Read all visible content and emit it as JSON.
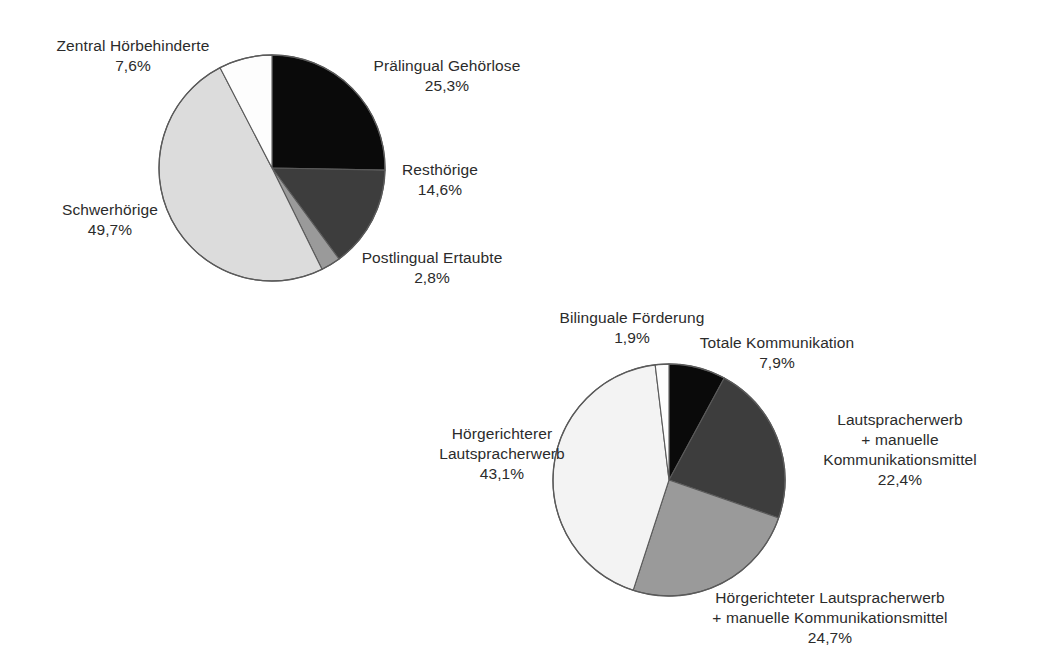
{
  "page": {
    "background": "#ffffff",
    "width": 1043,
    "height": 665
  },
  "palette": {
    "black": "#0a0a0a",
    "dark_gray": "#3d3d3d",
    "mid_gray": "#9a9a9a",
    "light_gray": "#dcdcdc",
    "white": "#fdfdfd",
    "outline": "#5a5a5a",
    "text": "#2b2b2b"
  },
  "chart_data": [
    {
      "type": "pie",
      "id": "hearing-impairment-types",
      "title": "",
      "labels": [
        "Prälingual Gehörlose",
        "Resthörige",
        "Postlingual Ertaubte",
        "Schwerhörige",
        "Zentral Hörbehinderte"
      ],
      "values": [
        25.3,
        14.6,
        2.8,
        49.7,
        7.6
      ],
      "value_labels": [
        "25,3%",
        "14,6%",
        "2,8%",
        "49,7%",
        "7,6%"
      ],
      "colors": [
        "#0a0a0a",
        "#3d3d3d",
        "#9a9a9a",
        "#dcdcdc",
        "#fdfdfd"
      ],
      "start_angle_deg": 0,
      "direction": "clockwise",
      "legend": "none",
      "grid": false,
      "slices": [
        {
          "label": "Prälingual Gehörlose",
          "value": 25.3,
          "value_label": "25,3%",
          "color": "#0a0a0a"
        },
        {
          "label": "Resthörige",
          "value": 14.6,
          "value_label": "14,6%",
          "color": "#3d3d3d"
        },
        {
          "label": "Postlingual Ertaubte",
          "value": 2.8,
          "value_label": "2,8%",
          "color": "#9a9a9a"
        },
        {
          "label": "Schwerhörige",
          "value": 49.7,
          "value_label": "49,7%",
          "color": "#dcdcdc"
        },
        {
          "label": "Zentral Hörbehinderte",
          "value": 7.6,
          "value_label": "7,6%",
          "color": "#fdfdfd"
        }
      ]
    },
    {
      "type": "pie",
      "id": "communication-methods",
      "title": "",
      "labels": [
        "Totale Kommunikation",
        "Lautspracherwerb + manuelle Kommunikationsmittel",
        "Hörgerichteter Lautspracherwerb + manuelle Kommunikationsmittel",
        "Hörgerichterer Lautspracherwerb",
        "Bilinguale Förderung"
      ],
      "values": [
        7.9,
        22.4,
        24.7,
        43.1,
        1.9
      ],
      "value_labels": [
        "7,9%",
        "22,4%",
        "24,7%",
        "43,1%",
        "1,9%"
      ],
      "colors": [
        "#0a0a0a",
        "#3d3d3d",
        "#9a9a9a",
        "#f3f3f3",
        "#fdfdfd"
      ],
      "start_angle_deg": 0,
      "direction": "clockwise",
      "legend": "none",
      "grid": false,
      "slices": [
        {
          "label": "Totale Kommunikation",
          "value": 7.9,
          "value_label": "7,9%",
          "color": "#0a0a0a"
        },
        {
          "label": "Lautspracherwerb + manuelle Kommunikationsmittel",
          "value": 22.4,
          "value_label": "22,4%",
          "color": "#3d3d3d"
        },
        {
          "label": "Hörgerichteter Lautspracherwerb + manuelle Kommunikationsmittel",
          "value": 24.7,
          "value_label": "24,7%",
          "color": "#9a9a9a"
        },
        {
          "label": "Hörgerichterer Lautspracherwerb",
          "value": 43.1,
          "value_label": "43,1%",
          "color": "#f3f3f3"
        },
        {
          "label": "Bilinguale Förderung",
          "value": 1.9,
          "value_label": "1,9%",
          "color": "#fdfdfd"
        }
      ]
    }
  ],
  "chart1": {
    "labels": {
      "zentral": {
        "title": "Zentral Hörbehinderte",
        "value": "7,6%"
      },
      "praelingual": {
        "title": "Prälingual Gehörlose",
        "value": "25,3%"
      },
      "resthoerige": {
        "title": "Resthörige",
        "value": "14,6%"
      },
      "postlingual": {
        "title": "Postlingual Ertaubte",
        "value": "2,8%"
      },
      "schwerhoerige": {
        "title": "Schwerhörige",
        "value": "49,7%"
      }
    }
  },
  "chart2": {
    "labels": {
      "bilingual": {
        "title": "Bilinguale Förderung",
        "value": "1,9%"
      },
      "totale": {
        "title": "Totale Kommunikation",
        "value": "7,9%"
      },
      "laut_manuell": {
        "line1": "Lautspracherwerb",
        "line2": "+ manuelle",
        "line3": "Kommunikationsmittel",
        "value": "22,4%"
      },
      "hoer_laut_manuell": {
        "line1": "Hörgerichteter Lautspracherwerb",
        "line2": "+ manuelle Kommunikationsmittel",
        "value": "24,7%"
      },
      "hoer_laut": {
        "line1": "Hörgerichterer",
        "line2": "Lautspracherwerb",
        "value": "43,1%"
      }
    }
  }
}
